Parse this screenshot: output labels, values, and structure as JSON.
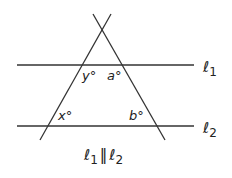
{
  "diagram": {
    "lines": {
      "l1": {
        "label_main": "ℓ",
        "label_sub": "1"
      },
      "l2": {
        "label_main": "ℓ",
        "label_sub": "2"
      }
    },
    "angles": {
      "y": "y°",
      "a": "a°",
      "x": "x°",
      "b": "b°"
    },
    "caption": {
      "l1_main": "ℓ",
      "l1_sub": "1",
      "parallel": "‖",
      "l2_main": "ℓ",
      "l2_sub": "2"
    }
  }
}
